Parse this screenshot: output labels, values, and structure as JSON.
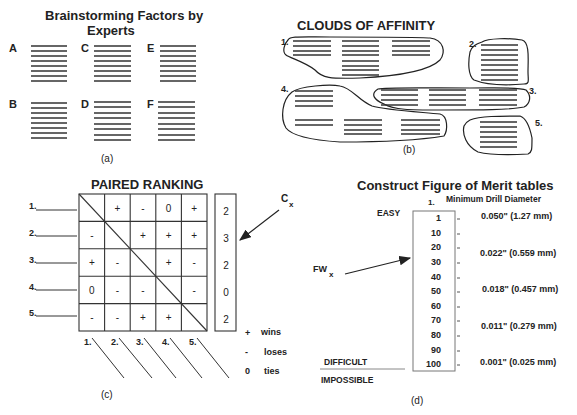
{
  "panel_a": {
    "title_line1": "Brainstorming   Factors   by",
    "title_line2": "Experts",
    "experts": [
      "A",
      "B",
      "C",
      "D",
      "E",
      "F"
    ],
    "caption": "(a)"
  },
  "panel_b": {
    "title": "CLOUDS  OF  AFFINITY",
    "cloud_labels": [
      "1.",
      "2.",
      "3.",
      "4.",
      "5."
    ],
    "caption": "(b)"
  },
  "panel_c": {
    "title": "PAIRED   RANKING",
    "row_labels": [
      "1.",
      "2.",
      "3.",
      "4.",
      "5."
    ],
    "col_labels": [
      "1.",
      "2.",
      "3.",
      "4.",
      "5."
    ],
    "matrix": [
      [
        "",
        "+",
        "-",
        "0",
        "+"
      ],
      [
        "-",
        "",
        "+",
        "+",
        "+"
      ],
      [
        "+",
        "-",
        "",
        "+",
        "-"
      ],
      [
        "0",
        "-",
        "-",
        "",
        "-"
      ],
      [
        "-",
        "-",
        "+",
        "+",
        ""
      ]
    ],
    "scores": [
      "2",
      "3",
      "2",
      "0",
      "2"
    ],
    "score_label": "C",
    "score_label_sub": "x",
    "legend": [
      {
        "symbol": "+",
        "meaning": "wins"
      },
      {
        "symbol": "-",
        "meaning": "loses"
      },
      {
        "symbol": "0",
        "meaning": "ties"
      }
    ],
    "caption": "(c)"
  },
  "panel_d": {
    "title": "Construct  Figure  of  Merit  tables",
    "column_index": "1.",
    "column_header": "Minimum  Drill  Diameter",
    "easy_label": "EASY",
    "difficult_label": "DIFFICULT",
    "impossible_label": "IMPOSSIBLE",
    "arrow_label": "FW",
    "arrow_label_sub": "x",
    "scale": [
      "1",
      "10",
      "20",
      "30",
      "40",
      "50",
      "60",
      "70",
      "80",
      "90",
      "100"
    ],
    "values": [
      {
        "text": "0.050\" (1.27 mm)",
        "at": "1"
      },
      {
        "text": "0.022\" (0.559 mm)",
        "at": "20-30"
      },
      {
        "text": "0.018\" (0.457 mm)",
        "at": "50"
      },
      {
        "text": "0.011\" (0.279 mm)",
        "at": "70-80"
      },
      {
        "text": "0.001\" (0.025 mm)",
        "at": "100"
      }
    ],
    "caption": "(d)"
  }
}
